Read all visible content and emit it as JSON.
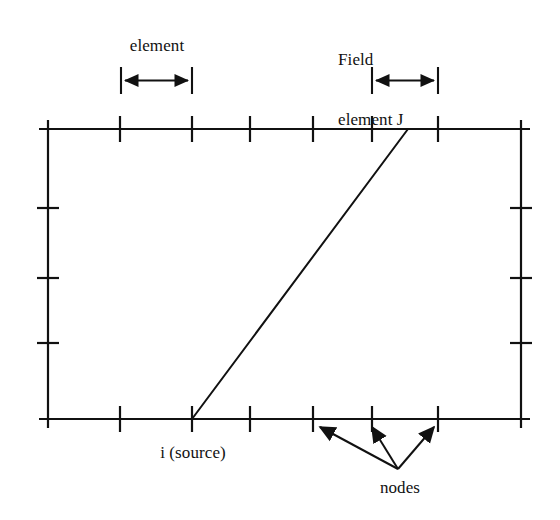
{
  "figure": {
    "type": "technical-diagram",
    "background_color": "#ffffff",
    "line_color": "#111111"
  },
  "labels": {
    "element": "element",
    "field_element_line1": "Field",
    "field_element_line2": "element J",
    "source": "i (source)",
    "nodes": "nodes"
  },
  "geometry": {
    "frame": {
      "left": 48,
      "right": 521,
      "top": 129,
      "bottom": 419,
      "overhang": 9,
      "stroke_width": 2.2
    },
    "top_ticks_x": [
      48,
      120,
      192,
      250,
      313,
      372,
      438,
      521
    ],
    "bottom_ticks_x": [
      48,
      120,
      192,
      250,
      313,
      372,
      438,
      521
    ],
    "left_ticks_y": [
      129,
      208,
      278,
      343,
      419
    ],
    "right_ticks_y": [
      129,
      208,
      278,
      343,
      419
    ],
    "tick_half_length": 13,
    "side_tick_half_length": 11,
    "diagonal": {
      "x1": 192,
      "y1": 419,
      "x2": 408,
      "y2": 129
    },
    "dimension_element": {
      "x1": 121,
      "x2": 192,
      "y": 80,
      "bar_top": 68,
      "bar_bottom": 93
    },
    "dimension_field_element": {
      "x1": 372,
      "x2": 438,
      "y": 80,
      "bar_top": 68,
      "bar_bottom": 93
    },
    "node_leaders": {
      "origin_x": 398,
      "origin_y": 470,
      "targets": [
        {
          "x": 316,
          "y": 424
        },
        {
          "x": 372,
          "y": 424
        },
        {
          "x": 436,
          "y": 424
        }
      ]
    }
  }
}
